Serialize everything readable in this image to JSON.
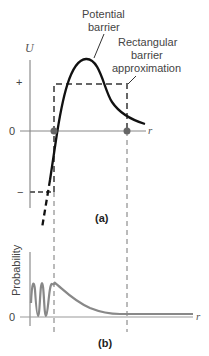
{
  "figure": {
    "panel_a": {
      "label": "(a)",
      "y_axis_label": "U",
      "x_axis_label": "r",
      "y_ticks": [
        "+",
        "0",
        "−"
      ],
      "annotations": {
        "potential_barrier_line1": "Potential",
        "potential_barrier_line2": "barrier",
        "rectangular_line1": "Rectangular",
        "rectangular_line2": "barrier",
        "rectangular_line3": "approximation"
      }
    },
    "panel_b": {
      "label": "(b)",
      "y_axis_label": "Probability",
      "x_axis_label": "r",
      "y_ticks": [
        "0"
      ]
    },
    "colors": {
      "curve": "#111111",
      "dashed": "#666666",
      "axis": "#777777",
      "probability_curve": "#888888",
      "dot": "#666666"
    }
  }
}
